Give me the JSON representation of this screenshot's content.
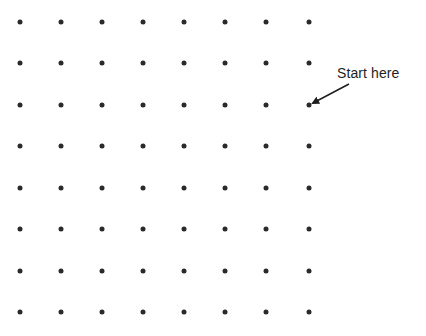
{
  "diagram": {
    "type": "dot-grid-puzzle",
    "grid": {
      "rows": 8,
      "cols": 8,
      "col_x": [
        20,
        61,
        102,
        143,
        184,
        225,
        266,
        309
      ],
      "row_y": [
        22,
        63,
        105,
        146,
        188,
        229,
        271,
        312
      ],
      "dot_color": "#2a2a2a"
    },
    "annotation": {
      "text": "Start here",
      "x": 337,
      "y": 65,
      "arrow": {
        "from": [
          349,
          84
        ],
        "to": [
          313,
          103
        ]
      },
      "target_dot": {
        "row": 3,
        "col": 8
      }
    }
  }
}
